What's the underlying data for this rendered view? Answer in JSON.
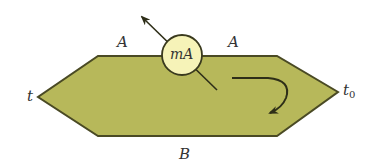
{
  "diagram": {
    "type": "galvanometer-loop-schematic",
    "colors": {
      "plate_fill": "#b7b85a",
      "plate_stroke": "#4a4a24",
      "meter_fill": "#f6f3b8",
      "meter_stroke": "#3a3a1e",
      "line": "#2e2e18",
      "label": "#333333"
    },
    "meter": {
      "label": "mA"
    },
    "labels": {
      "top_left": "A",
      "top_right": "A",
      "left_end": "t",
      "right_end_base": "t",
      "right_end_sub": "0",
      "bottom": "B"
    }
  }
}
